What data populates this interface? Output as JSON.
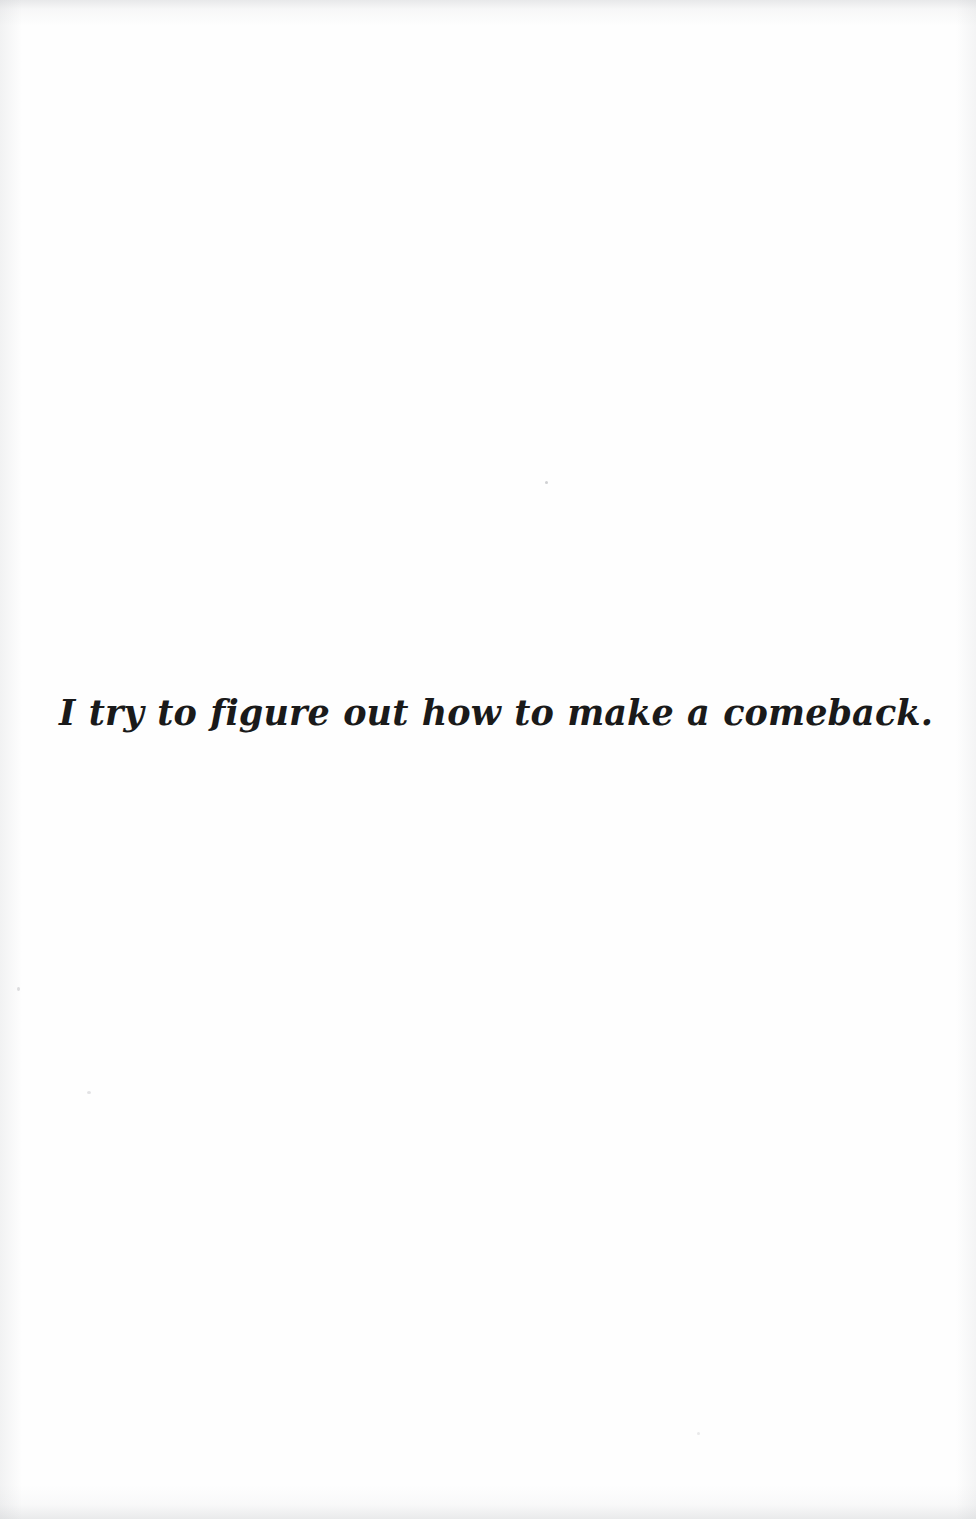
{
  "page": {
    "kind": "scanned-book-page",
    "width": 976,
    "height": 1519,
    "background_color": "#fefefe",
    "ink_color": "#1a1a1a"
  },
  "content": {
    "line": "I try to figure out how to make a comeback."
  },
  "artifacts": {
    "specks": [
      "speck-a",
      "speck-b",
      "speck-c",
      "speck-d"
    ],
    "edges": [
      "top",
      "bottom",
      "left",
      "right"
    ]
  }
}
